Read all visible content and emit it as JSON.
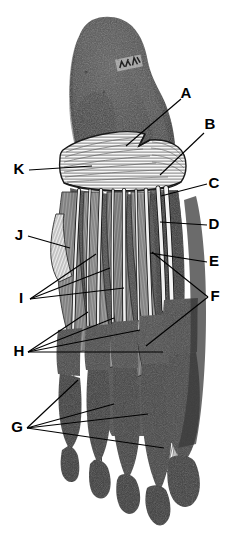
{
  "figure": {
    "type": "anatomical-illustration",
    "width": 243,
    "height": 539,
    "background_color": "#ffffff",
    "ink_color": "#000000",
    "bone_color": "#4a4a4a",
    "bone_dark_color": "#3a3a3a",
    "tendon_color": "#f2f2f2",
    "muscle_color": "#8c8c8c",
    "aponeurosis_color": "#f7f7f7",
    "specimen_marking": "illegible handwritten specimen mark on calcaneus"
  },
  "labels": [
    {
      "id": "A",
      "letter": "A",
      "x": 186,
      "y": 94
    },
    {
      "id": "B",
      "letter": "B",
      "x": 210,
      "y": 125
    },
    {
      "id": "C",
      "letter": "C",
      "x": 214,
      "y": 184
    },
    {
      "id": "D",
      "letter": "D",
      "x": 214,
      "y": 225
    },
    {
      "id": "E",
      "letter": "E",
      "x": 214,
      "y": 262
    },
    {
      "id": "F",
      "letter": "F",
      "x": 215,
      "y": 297
    },
    {
      "id": "G",
      "letter": "G",
      "x": 17,
      "y": 428
    },
    {
      "id": "H",
      "letter": "H",
      "x": 19,
      "y": 352
    },
    {
      "id": "I",
      "letter": "I",
      "x": 21,
      "y": 299
    },
    {
      "id": "J",
      "letter": "J",
      "x": 19,
      "y": 236
    },
    {
      "id": "K",
      "letter": "K",
      "x": 19,
      "y": 170
    }
  ],
  "leader_lines": [
    {
      "label": "A",
      "points": "181,99 126,146"
    },
    {
      "label": "B",
      "points": "204,133 160,175"
    },
    {
      "label": "C",
      "points": "207,184 161,196"
    },
    {
      "label": "D",
      "points": "207,225 160,222"
    },
    {
      "label": "E",
      "points": "207,262 150,253"
    },
    {
      "label": "F",
      "points": "208,297 152,252"
    },
    {
      "label": "F",
      "points": "208,297 146,346"
    },
    {
      "label": "G",
      "points": "27,428 78,380"
    },
    {
      "label": "G",
      "points": "27,428 114,404"
    },
    {
      "label": "G",
      "points": "27,428 148,414"
    },
    {
      "label": "G",
      "points": "27,428 164,448"
    },
    {
      "label": "H",
      "points": "28,352 88,312"
    },
    {
      "label": "H",
      "points": "28,352 114,318"
    },
    {
      "label": "H",
      "points": "28,352 140,330"
    },
    {
      "label": "H",
      "points": "28,352 163,352"
    },
    {
      "label": "I",
      "points": "30,299 96,254"
    },
    {
      "label": "I",
      "points": "30,299 110,268"
    },
    {
      "label": "I",
      "points": "30,299 124,288"
    },
    {
      "label": "J",
      "points": "28,236 70,248"
    },
    {
      "label": "K",
      "points": "29,170 92,166"
    }
  ],
  "structures": {
    "calcaneus": "dark heel bone mass at top of figure",
    "aponeurosis_band": "white transverse striated band across midfoot with notch",
    "toes": [
      "fifth toe (lateral)",
      "fourth toe",
      "third toe",
      "second toe",
      "great toe (hallux, medial) with fan-shaped tendon insertion"
    ],
    "long_tendons": "white longitudinal flexor tendons running from midfoot to the toes",
    "muscle_bellies": "grey striated plantar muscle bellies between tendons"
  }
}
